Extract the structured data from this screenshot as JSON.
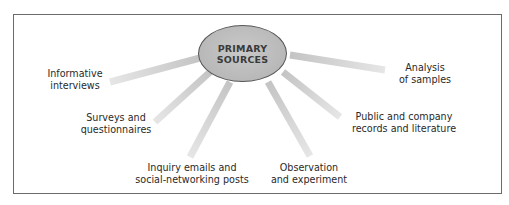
{
  "diagram": {
    "center": {
      "line1": "PRIMARY",
      "line2": "SOURCES"
    },
    "colors": {
      "hub_fill": "#bdbdbd",
      "hub_border": "#555555",
      "spoke": "#cfcfcf",
      "frame_border": "#6b6b6b",
      "text": "#2a2a2a"
    },
    "nodes": [
      {
        "id": "informative-interviews",
        "line1": "Informative",
        "line2": "interviews"
      },
      {
        "id": "surveys-questionnaires",
        "line1": "Surveys and",
        "line2": "questionnaires"
      },
      {
        "id": "inquiry-emails",
        "line1": "Inquiry emails and",
        "line2": "social-networking posts"
      },
      {
        "id": "observation-experiment",
        "line1": "Observation",
        "line2": "and experiment"
      },
      {
        "id": "public-company-records",
        "line1": "Public and company",
        "line2": "records and literature"
      },
      {
        "id": "analysis-samples",
        "line1": "Analysis",
        "line2": "of samples"
      }
    ]
  }
}
